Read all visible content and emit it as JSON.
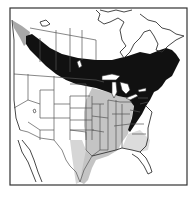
{
  "map": {
    "type": "species-range-map",
    "region": "North America",
    "frame": {
      "x": 10,
      "y": 8,
      "width": 177,
      "height": 177
    },
    "colors": {
      "background": "#ffffff",
      "primary_range": "#111111",
      "secondary_range": "#bdbdbd",
      "western_secondary": "#a8a8a8",
      "borders": "#555555",
      "frame": "#333333"
    },
    "legend": {
      "primary_range_label": "",
      "secondary_range_label": ""
    }
  }
}
